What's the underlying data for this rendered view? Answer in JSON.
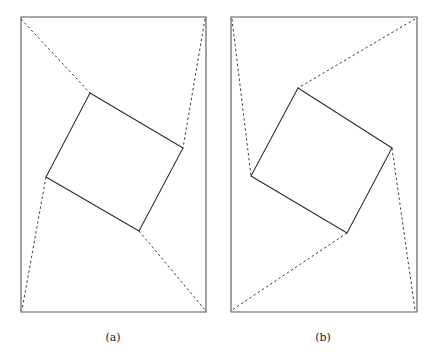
{
  "figure": {
    "background_color": "#ffffff",
    "width": 438,
    "height": 358,
    "panels": [
      {
        "id": "panel-a",
        "caption": "(a)",
        "caption_position": {
          "x": 113,
          "y": 341
        },
        "frame": {
          "name": "paper-sheet-outline",
          "style": "solid",
          "color": "#555555",
          "corners": [
            {
              "x": 21,
              "y": 17
            },
            {
              "x": 206,
              "y": 17
            },
            {
              "x": 206,
              "y": 312
            },
            {
              "x": 21,
              "y": 312
            }
          ]
        },
        "inner_quad": {
          "name": "inscribed-square",
          "style": "solid",
          "color": "#2b2b2b",
          "corners": [
            {
              "x": 90,
              "y": 93
            },
            {
              "x": 183,
              "y": 148
            },
            {
              "x": 139,
              "y": 231
            },
            {
              "x": 46,
              "y": 177
            }
          ]
        },
        "fold_lines": [
          {
            "name": "fold-top-left",
            "style": "dashed",
            "points": [
              {
                "x": 21,
                "y": 19
              },
              {
                "x": 90,
                "y": 93
              }
            ]
          },
          {
            "name": "fold-top-right",
            "style": "dashed",
            "points": [
              {
                "x": 205,
                "y": 19
              },
              {
                "x": 183,
                "y": 148
              }
            ]
          },
          {
            "name": "fold-bottom-left",
            "style": "dashed",
            "points": [
              {
                "x": 46,
                "y": 177
              },
              {
                "x": 22,
                "y": 310
              }
            ]
          },
          {
            "name": "fold-bottom-right",
            "style": "dashed",
            "points": [
              {
                "x": 139,
                "y": 231
              },
              {
                "x": 205,
                "y": 310
              }
            ]
          }
        ]
      },
      {
        "id": "panel-b",
        "caption": "(b)",
        "caption_position": {
          "x": 323,
          "y": 341
        },
        "frame": {
          "name": "paper-sheet-outline",
          "style": "solid",
          "color": "#555555",
          "corners": [
            {
              "x": 231,
              "y": 17
            },
            {
              "x": 417,
              "y": 17
            },
            {
              "x": 417,
              "y": 312
            },
            {
              "x": 231,
              "y": 312
            }
          ]
        },
        "inner_quad": {
          "name": "inscribed-square",
          "style": "solid",
          "color": "#2b2b2b",
          "corners": [
            {
              "x": 298,
              "y": 88
            },
            {
              "x": 392,
              "y": 148
            },
            {
              "x": 347,
              "y": 233
            },
            {
              "x": 251,
              "y": 176
            }
          ]
        },
        "fold_lines": [
          {
            "name": "fold-top-left",
            "style": "dashed",
            "points": [
              {
                "x": 232,
                "y": 19
              },
              {
                "x": 251,
                "y": 176
              }
            ]
          },
          {
            "name": "fold-top-right",
            "style": "dashed",
            "points": [
              {
                "x": 415,
                "y": 19
              },
              {
                "x": 298,
                "y": 88
              }
            ]
          },
          {
            "name": "fold-bottom-left",
            "style": "dashed",
            "points": [
              {
                "x": 347,
                "y": 233
              },
              {
                "x": 232,
                "y": 310
              }
            ]
          },
          {
            "name": "fold-bottom-right",
            "style": "dashed",
            "points": [
              {
                "x": 392,
                "y": 148
              },
              {
                "x": 415,
                "y": 310
              }
            ]
          }
        ]
      }
    ]
  }
}
